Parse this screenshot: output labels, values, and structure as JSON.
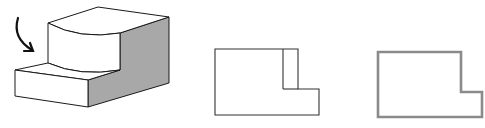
{
  "figure": {
    "colors": {
      "background": "#ffffff",
      "line": "#1a1a1a",
      "shaded_face": "#a8a8a8",
      "highlight_outline": "#8a8a8a"
    },
    "isometric": {
      "label": "isometric-view",
      "arrow": "viewing-direction"
    },
    "views": [
      {
        "label": "front-view-with-hidden-edge"
      },
      {
        "label": "outline-view"
      }
    ]
  }
}
